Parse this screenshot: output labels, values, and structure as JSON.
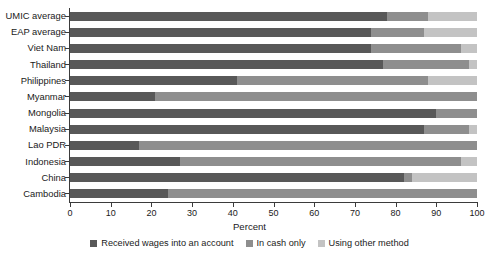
{
  "chart_data": {
    "type": "bar",
    "orientation": "horizontal",
    "stacked": true,
    "title": "",
    "xlabel": "Percent",
    "ylabel": "",
    "xlim": [
      0,
      100
    ],
    "xticks": [
      0,
      10,
      20,
      30,
      40,
      50,
      60,
      70,
      80,
      90,
      100
    ],
    "grid": false,
    "legend_position": "bottom",
    "categories": [
      "UMIC average",
      "EAP average",
      "Viet Nam",
      "Thailand",
      "Philippines",
      "Myanmar",
      "Mongolia",
      "Malaysia",
      "Lao PDR",
      "Indonesia",
      "China",
      "Cambodia"
    ],
    "series": [
      {
        "name": "Received wages into an account",
        "color": "#585858",
        "values": [
          78,
          74,
          74,
          77,
          41,
          21,
          90,
          87,
          17,
          27,
          82,
          24
        ]
      },
      {
        "name": "In cash only",
        "color": "#8e8e8e",
        "values": [
          10,
          13,
          22,
          21,
          47,
          79,
          10,
          11,
          83,
          69,
          2,
          76
        ]
      },
      {
        "name": "Using other method",
        "color": "#c3c3c3",
        "values": [
          12,
          13,
          4,
          2,
          12,
          0,
          0,
          2,
          0,
          4,
          16,
          0
        ]
      }
    ]
  },
  "legend": {
    "items": [
      {
        "label": "Received wages into an account",
        "color": "#585858"
      },
      {
        "label": "In cash only",
        "color": "#8e8e8e"
      },
      {
        "label": "Using other method",
        "color": "#c3c3c3"
      }
    ]
  },
  "axis": {
    "x_title": "Percent"
  }
}
